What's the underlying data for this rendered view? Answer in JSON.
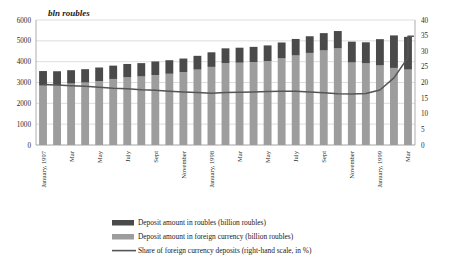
{
  "chart_data": {
    "type": "bar",
    "title": "bln roubles",
    "xlabel": "",
    "ylabel": "bln roubles",
    "ylim": [
      0,
      6000
    ],
    "y2lim": [
      0,
      40
    ],
    "y2label": "%",
    "grid": true,
    "legend_position": "bottom",
    "yticks": [
      "6000",
      "5000",
      "4000",
      "3000",
      "2000",
      "1000",
      "0"
    ],
    "ytick_values": [
      6000,
      5000,
      4000,
      3000,
      2000,
      1000,
      0
    ],
    "y2ticks": [
      "40",
      "35",
      "30",
      "25",
      "20",
      "15",
      "10",
      "5",
      "0"
    ],
    "y2tick_values": [
      40,
      35,
      30,
      25,
      20,
      15,
      10,
      5,
      0
    ],
    "categories": [
      "January, 1997",
      "February",
      "Mar",
      "April",
      "May",
      "June",
      "July",
      "August",
      "Sept",
      "October",
      "November",
      "December",
      "January, 1998",
      "February",
      "Mar",
      "April",
      "May",
      "June",
      "July",
      "August",
      "Sept",
      "October",
      "November",
      "December",
      "January, 1999",
      "February",
      "Mar"
    ],
    "tick_labels_shown": [
      "January, 1997",
      "",
      "Mar",
      "",
      "May",
      "",
      "July",
      "",
      "Sept",
      "",
      "November",
      "",
      "January, 1998",
      "",
      "Mar",
      "",
      "May",
      "",
      "July",
      "",
      "Sept",
      "",
      "November",
      "",
      "January, 1999",
      "",
      "Mar"
    ],
    "series": [
      {
        "name": "Deposit amount in foreign currency (billion roubles)",
        "type": "bar-segment",
        "stack": "deposits",
        "color": "#9d9d9d",
        "values": [
          2850,
          2870,
          2950,
          3000,
          3070,
          3170,
          3250,
          3290,
          3360,
          3420,
          3500,
          3620,
          3750,
          3930,
          3950,
          3980,
          4030,
          4160,
          4300,
          4420,
          4540,
          4640,
          3960,
          3920,
          3820,
          3700,
          3620
        ]
      },
      {
        "name": "Deposit amount in roubles (billion roubles)",
        "type": "bar-segment",
        "stack": "deposits",
        "color": "#4a4a4a",
        "values": [
          700,
          670,
          640,
          640,
          650,
          640,
          640,
          640,
          650,
          650,
          650,
          660,
          700,
          710,
          720,
          730,
          750,
          760,
          790,
          800,
          830,
          830,
          1000,
          1010,
          1260,
          1560,
          1570
        ]
      },
      {
        "name": "Share of foreign currency deposits (right-hand scale, in %)",
        "type": "line",
        "axis": "right",
        "color": "#555555",
        "values": [
          19.4,
          19.2,
          19.0,
          18.8,
          18.5,
          18.2,
          18.0,
          17.7,
          17.5,
          17.2,
          17.0,
          16.8,
          16.6,
          16.8,
          16.9,
          17.0,
          17.1,
          17.2,
          17.2,
          17.0,
          16.7,
          16.4,
          16.3,
          16.5,
          17.6,
          21.5,
          28.0
        ]
      }
    ],
    "line_extra_points": [
      {
        "label": "Mar 1999 end",
        "value": 34.8
      },
      {
        "label": "final flat",
        "value": 34.8
      }
    ]
  },
  "legend": {
    "items": [
      {
        "label": "Deposit amount in roubles (billion roubles)",
        "marker": "swatch",
        "color": "#4a4a4a"
      },
      {
        "label": "Deposit amount in foreign currency (billion roubles)",
        "marker": "swatch",
        "color": "#9d9d9d"
      },
      {
        "label": "Share of foreign currency deposits (right-hand scale, in %)",
        "marker": "line",
        "color": "#555555"
      }
    ]
  },
  "colors": {
    "bar_roubles": "#4a4a4a",
    "bar_foreign": "#9d9d9d",
    "line": "#555555",
    "grid": "#cfcfcf",
    "axis": "#9a9a9a",
    "text": "#1c1c1c",
    "background": "#ffffff"
  }
}
